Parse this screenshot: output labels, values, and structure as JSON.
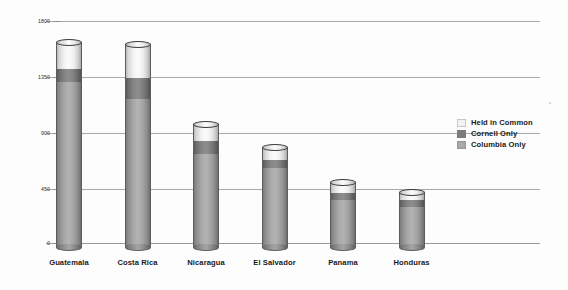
{
  "chart_data": {
    "type": "bar",
    "subtype": "stacked-cylinder",
    "title": "",
    "xlabel": "",
    "ylabel": "",
    "ylim": [
      0,
      1800
    ],
    "yticks": [
      0,
      450,
      900,
      1350,
      1800
    ],
    "ytick_labels": [
      "0",
      "450",
      "900",
      "1350",
      "1800"
    ],
    "grid": true,
    "legend_position": "right",
    "categories": [
      "Guatemala",
      "Costa Rica",
      "Nicaragua",
      "El Salvador",
      "Panama",
      "Honduras"
    ],
    "series": [
      {
        "name": "Columbia Only",
        "color": "#a9a9a9",
        "values": [
          1334,
          1198,
          755,
          643,
          378,
          321
        ]
      },
      {
        "name": "Cornell Only",
        "color": "#7d7d7d",
        "values": [
          112,
          176,
          105,
          64,
          64,
          57
        ]
      },
      {
        "name": "Held in Common",
        "color": "#f2f2f2",
        "values": [
          209,
          265,
          137,
          96,
          80,
          64
        ]
      }
    ],
    "totals": [
      1655,
      1639,
      997,
      803,
      522,
      442
    ],
    "stack_order_bottom_to_top": [
      "Columbia Only",
      "Cornell Only",
      "Held in Common"
    ]
  },
  "legend": {
    "items": [
      {
        "label": "Held in Common",
        "color": "#f2f2f2"
      },
      {
        "label": "Cornell Only",
        "color": "#7d7d7d"
      },
      {
        "label": "Columbia Only",
        "color": "#a9a9a9"
      }
    ]
  },
  "axis": {
    "y_ticks": [
      {
        "label": "1800",
        "value": 1800
      },
      {
        "label": "1350",
        "value": 1350
      },
      {
        "label": "900",
        "value": 900
      },
      {
        "label": "450",
        "value": 450
      },
      {
        "label": "0",
        "value": 0
      }
    ]
  }
}
